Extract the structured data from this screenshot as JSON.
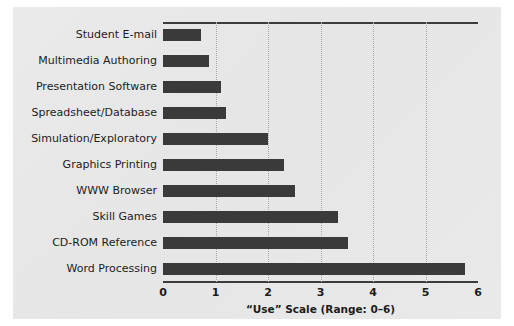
{
  "chart_data": {
    "type": "bar",
    "orientation": "horizontal",
    "title": "",
    "xlabel": "“Use” Scale (Range: 0–6)",
    "ylabel": "",
    "xlim": [
      0,
      6
    ],
    "xticks": [
      "0",
      "1",
      "2",
      "3",
      "4",
      "5",
      "6"
    ],
    "grid": "vertical-dotted",
    "legend": "none",
    "categories": [
      "Student E-mail",
      "Multimedia Authoring",
      "Presentation Software",
      "Spreadsheet/Database",
      "Simulation/Exploratory",
      "Graphics Printing",
      "WWW Browser",
      "Skill Games",
      "CD-ROM Reference",
      "Word Processing"
    ],
    "values": [
      0.72,
      0.88,
      1.11,
      1.2,
      2.0,
      2.3,
      2.52,
      3.33,
      3.53,
      5.75
    ],
    "bar_color": "#3a3a3a",
    "panel_color": "#e8e8e8",
    "axis_color": "#3c3c3c",
    "gridline_color": "#a9a9a9"
  }
}
